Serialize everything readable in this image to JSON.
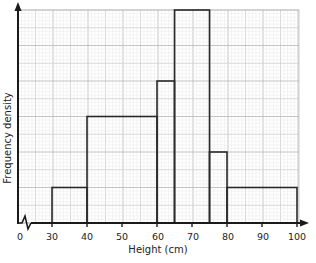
{
  "chart_data": {
    "type": "histogram",
    "title": "",
    "xlabel": "Height (cm)",
    "ylabel": "Frequency density",
    "x_tick_labels": [
      "0",
      "30",
      "40",
      "50",
      "60",
      "70",
      "80",
      "90",
      "100"
    ],
    "x_ticks": [
      30,
      40,
      50,
      60,
      70,
      80,
      90,
      100
    ],
    "x_axis_break": "zigzag between 0 and 30",
    "y_ticks_labeled": false,
    "y_range_grid_units": [
      0,
      6
    ],
    "grid": true,
    "bins": [
      {
        "from": 30,
        "to": 40,
        "frequency_density": 1
      },
      {
        "from": 40,
        "to": 60,
        "frequency_density": 3
      },
      {
        "from": 60,
        "to": 65,
        "frequency_density": 4
      },
      {
        "from": 65,
        "to": 75,
        "frequency_density": 6
      },
      {
        "from": 75,
        "to": 80,
        "frequency_density": 2
      },
      {
        "from": 80,
        "to": 100,
        "frequency_density": 1
      }
    ],
    "y_unit_note": "Heights in major grid squares (y-axis scale not labeled)"
  },
  "colors": {
    "axis": "#1a1a1a",
    "bar_outline": "#2a2a2a",
    "grid_major": "#bdbdbd",
    "grid_mid": "#d4d4d4",
    "grid_minor": "#ececec"
  },
  "labels": {
    "x_zero": "0",
    "x_30": "30",
    "x_40": "40",
    "x_50": "50",
    "x_60": "60",
    "x_70": "70",
    "x_80": "80",
    "x_90": "90",
    "x_100": "100",
    "xlabel": "Height (cm)",
    "ylabel": "Frequency density"
  }
}
